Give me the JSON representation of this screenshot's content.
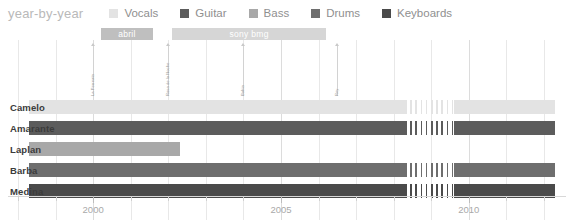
{
  "header": {
    "title": "year-by-year"
  },
  "legend": {
    "position": "top",
    "items": [
      {
        "label": "Vocals",
        "color": "#e3e3e3"
      },
      {
        "label": "Guitar",
        "color": "#5c5c5c"
      },
      {
        "label": "Bass",
        "color": "#a8a8a8"
      },
      {
        "label": "Drums",
        "color": "#6e6e6e"
      },
      {
        "label": "Keyboards",
        "color": "#4a4a4a"
      }
    ]
  },
  "chart_data": {
    "type": "bar",
    "orientation": "horizontal",
    "subtype": "timeline",
    "title": "year-by-year",
    "xlabel": "",
    "ylabel": "",
    "xlim": [
      1998,
      2012
    ],
    "grid": true,
    "tick_labels": [
      "2000",
      "2005",
      "2010"
    ],
    "tick_values": [
      2000,
      2005,
      2010
    ],
    "minor_tick_values": [
      1998,
      1999,
      2001,
      2002,
      2003,
      2004,
      2006,
      2007,
      2008,
      2009,
      2011,
      2012
    ],
    "categories": [
      "Camelo",
      "Amarante",
      "Laplan",
      "Barba",
      "Medina"
    ],
    "series": [
      {
        "name": "Camelo",
        "role": "Vocals",
        "color": "#e3e3e3",
        "segments": [
          {
            "start": 1998.3,
            "end": 2008.3,
            "style": "solid"
          },
          {
            "start": 2008.3,
            "end": 2009.6,
            "style": "hatched"
          },
          {
            "start": 2009.6,
            "end": 2012.3,
            "style": "solid"
          }
        ]
      },
      {
        "name": "Amarante",
        "role": "Guitar",
        "color": "#5c5c5c",
        "secondary_color": "#a8a8a8",
        "segments": [
          {
            "start": 1998.3,
            "end": 2008.3,
            "style": "solid"
          },
          {
            "start": 2008.3,
            "end": 2009.6,
            "style": "hatched"
          },
          {
            "start": 2009.6,
            "end": 2012.3,
            "style": "solid"
          }
        ]
      },
      {
        "name": "Laplan",
        "role": "Bass",
        "color": "#a8a8a8",
        "segments": [
          {
            "start": 1998.3,
            "end": 2002.3,
            "style": "solid"
          }
        ]
      },
      {
        "name": "Barba",
        "role": "Drums",
        "color": "#6e6e6e",
        "segments": [
          {
            "start": 1998.3,
            "end": 2008.3,
            "style": "solid"
          },
          {
            "start": 2008.3,
            "end": 2009.6,
            "style": "hatched"
          },
          {
            "start": 2009.6,
            "end": 2012.3,
            "style": "solid"
          }
        ]
      },
      {
        "name": "Medina",
        "role": "Keyboards",
        "color": "#4a4a4a",
        "segments": [
          {
            "start": 1998.3,
            "end": 2008.3,
            "style": "solid"
          },
          {
            "start": 2008.3,
            "end": 2009.6,
            "style": "hatched"
          },
          {
            "start": 2009.6,
            "end": 2012.3,
            "style": "solid"
          }
        ]
      }
    ],
    "eras": [
      {
        "label": "abril",
        "start": 2000.2,
        "end": 2001.6,
        "color": "#bfbfbf"
      },
      {
        "label": "sony bmg",
        "start": 2002.1,
        "end": 2006.2,
        "color": "#d6d6d6"
      }
    ],
    "events": [
      {
        "label": "La Perreata",
        "value": 2000.0
      },
      {
        "label": "Rosa de la Noche",
        "value": 2002.0
      },
      {
        "label": "Bahia",
        "value": 2004.0
      },
      {
        "label": "Rey",
        "value": 2006.5
      }
    ]
  }
}
